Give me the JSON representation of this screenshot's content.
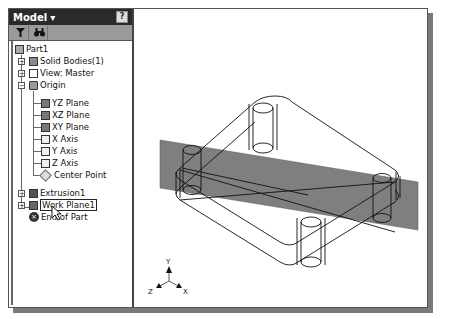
{
  "panel": {
    "title": "Model",
    "title_dropdown_glyph": "▾",
    "help_glyph": "?",
    "toolbar": [
      {
        "name": "filter",
        "glyph": "▼"
      },
      {
        "name": "find",
        "glyph": "🔭"
      }
    ]
  },
  "tree": [
    {
      "label": "Part1",
      "icon": "part-icon",
      "level": 0,
      "expander": null
    },
    {
      "label": "Solid Bodies(1)",
      "icon": "solid-bodies-icon",
      "level": 1,
      "expander": "+"
    },
    {
      "label": "View: Master",
      "icon": "view-icon",
      "level": 1,
      "expander": "+"
    },
    {
      "label": "Origin",
      "icon": "folder-icon",
      "level": 1,
      "expander": "-"
    },
    {
      "label": "YZ Plane",
      "icon": "plane-icon",
      "level": 2,
      "expander": null
    },
    {
      "label": "XZ Plane",
      "icon": "plane-icon",
      "level": 2,
      "expander": null
    },
    {
      "label": "XY Plane",
      "icon": "plane-icon",
      "level": 2,
      "expander": null
    },
    {
      "label": "X Axis",
      "icon": "axis-icon",
      "level": 2,
      "expander": null
    },
    {
      "label": "Y Axis",
      "icon": "axis-icon",
      "level": 2,
      "expander": null
    },
    {
      "label": "Z Axis",
      "icon": "axis-icon",
      "level": 2,
      "expander": null
    },
    {
      "label": "Center Point",
      "icon": "center-point-icon",
      "level": 2,
      "expander": null
    },
    {
      "label": "Extrusion1",
      "icon": "extrusion-icon",
      "level": 1,
      "expander": "+"
    },
    {
      "label": "Work Plane1",
      "icon": "work-plane-icon",
      "level": 1,
      "expander": "+",
      "selected": true
    },
    {
      "label": "End of Part",
      "icon": "end-of-part-icon",
      "level": 1,
      "expander": null
    }
  ],
  "viewport": {
    "triad": {
      "x_label": "X",
      "y_label": "Y",
      "z_label": "Z"
    },
    "work_plane_color": "#7f7f7f"
  },
  "colors": {
    "header_bg": "#2a2a2a",
    "toolbar_bg": "#9a9a9a",
    "shadow": "#7a7a7a"
  }
}
